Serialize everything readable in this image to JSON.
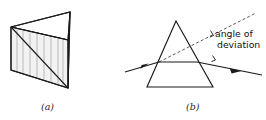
{
  "figure": {
    "panels": [
      {
        "id": "a",
        "caption": "(a)",
        "description": "three-dimensional triangular glass prism"
      },
      {
        "id": "b",
        "caption": "(b)",
        "description": "ray diagram of light refracted through a prism"
      }
    ],
    "annotations": {
      "deviation_line1": "angle of",
      "deviation_line2": "deviation"
    },
    "colors": {
      "ink": "#1a1a1a",
      "dashed_ink": "#4a4a4a",
      "background": "#ffffff",
      "front_face": "#f2f2f2",
      "side_face": "#fbfbfb"
    },
    "geometry": {
      "prism3d": {
        "front_face": "11,27 11,70 68,88 68,40",
        "top_edge": "11,27 70,12 68,40",
        "right_face": "68,40 70,12 68,88",
        "diagonal": "11,27 68,88"
      },
      "prism2d": {
        "triangle": "176,21 147,87 213,87"
      },
      "rays": {
        "incident": "125,72 159,62",
        "internal": "159,62 197,62",
        "emergent": "197,62 262,75",
        "extension_dashed": "159,62 256,13"
      }
    }
  }
}
